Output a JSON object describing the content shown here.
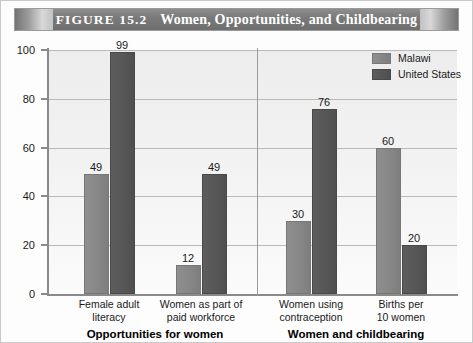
{
  "figure": {
    "number_label": "FIGURE 15.2",
    "title": "Women, Opportunities, and Childbearing"
  },
  "legend": {
    "position": "top-right",
    "entries": [
      {
        "label": "Malawi",
        "color": "#868686"
      },
      {
        "label": "United States",
        "color": "#565656"
      }
    ]
  },
  "groups": [
    {
      "label": "Opportunities for women"
    },
    {
      "label": "Women and childbearing"
    }
  ],
  "chart_data": {
    "type": "bar",
    "title": "Women, Opportunities, and Childbearing",
    "xlabel": "",
    "ylabel": "",
    "ylim": [
      0,
      100
    ],
    "yticks": [
      0,
      20,
      40,
      60,
      80,
      100
    ],
    "ytick_labels": [
      "0",
      "20",
      "40",
      "60",
      "80",
      "100"
    ],
    "grid": true,
    "legend_position": "top-right",
    "categories": [
      "Female adult literacy",
      "Women as part of paid workforce",
      "Women using contraception",
      "Births per 10 women"
    ],
    "category_lines": [
      [
        "Female adult",
        "literacy"
      ],
      [
        "Women as part of",
        "paid workforce"
      ],
      [
        "Women using",
        "contraception"
      ],
      [
        "Births per",
        "10 women"
      ]
    ],
    "group_labels": [
      "Opportunities for women",
      "Women and childbearing"
    ],
    "group_spans": [
      [
        0,
        1
      ],
      [
        2,
        3
      ]
    ],
    "series": [
      {
        "name": "Malawi",
        "color": "#868686",
        "values": [
          49,
          12,
          30,
          60
        ]
      },
      {
        "name": "United States",
        "color": "#565656",
        "values": [
          99,
          49,
          76,
          20
        ]
      }
    ],
    "data_labels": [
      {
        "category": "Female adult literacy",
        "Malawi": 49,
        "United States": 99
      },
      {
        "category": "Women as part of paid workforce",
        "Malawi": 12,
        "United States": 49
      },
      {
        "category": "Women using contraception",
        "Malawi": 30,
        "United States": 76
      },
      {
        "category": "Births per 10 women",
        "Malawi": 60,
        "United States": 20
      }
    ]
  }
}
